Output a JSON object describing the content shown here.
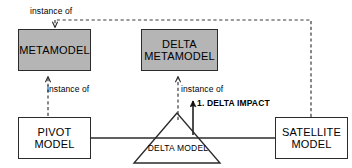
{
  "diagram": {
    "colors": {
      "fill_gray": "#b5b5b5",
      "fill_white": "#ffffff",
      "stroke": "#2b2b2b",
      "text": "#000000",
      "background": "#ffffff"
    },
    "nodes": [
      {
        "id": "metamodel",
        "label": "METAMODEL",
        "shape": "rectangle",
        "fill": "gray"
      },
      {
        "id": "delta_metamodel",
        "label": "DELTA\nMETAMODEL",
        "shape": "rectangle",
        "fill": "gray"
      },
      {
        "id": "pivot_model",
        "label": "PIVOT\nMODEL",
        "shape": "rectangle",
        "fill": "white"
      },
      {
        "id": "satellite_model",
        "label": "SATELLITE\nMODEL",
        "shape": "rectangle",
        "fill": "white"
      },
      {
        "id": "delta_model",
        "label": "DELTA MODEL",
        "shape": "triangle",
        "fill": "white"
      }
    ],
    "edges": [
      {
        "id": "e1",
        "label": "instance of",
        "style": "dashed",
        "from": "satellite_model",
        "to": "metamodel",
        "arrow": "open"
      },
      {
        "id": "e2",
        "label": "instance of",
        "style": "dashed",
        "from": "pivot_model",
        "to": "metamodel",
        "arrow": "open"
      },
      {
        "id": "e3",
        "label": "instance of",
        "style": "dashed",
        "from": "delta_model",
        "to": "delta_metamodel",
        "arrow": "open"
      },
      {
        "id": "e4",
        "label": "1. DELTA IMPACT",
        "style": "solid",
        "from": "delta_model",
        "to": "delta_metamodel",
        "arrow": "filled"
      },
      {
        "id": "e5",
        "label": "",
        "style": "solid",
        "from": "pivot_model",
        "to": "satellite_model",
        "arrow": "none"
      }
    ],
    "labels": {
      "instance_of_top": "instance of",
      "instance_of_left": "instance of",
      "instance_of_center": "instance of",
      "delta_impact": "1. DELTA IMPACT",
      "delta_model_caption": "DELTA MODEL"
    }
  }
}
